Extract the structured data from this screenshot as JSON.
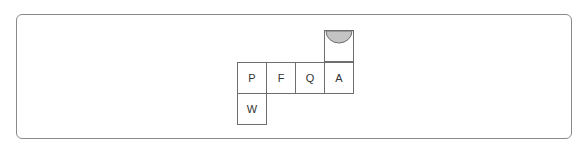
{
  "diagram": {
    "type": "cube-net",
    "colors": {
      "border": "#6e6e6e",
      "semicircle_fill": "#c4c4c4",
      "frame": "#8a8a8a"
    },
    "cells": [
      {
        "id": "top",
        "label": "",
        "col": 3,
        "row": 0,
        "decoration": "semicircle"
      },
      {
        "id": "P",
        "label": "P",
        "col": 0,
        "row": 1
      },
      {
        "id": "F",
        "label": "F",
        "col": 1,
        "row": 1
      },
      {
        "id": "Q",
        "label": "Q",
        "col": 2,
        "row": 1
      },
      {
        "id": "A",
        "label": "A",
        "col": 3,
        "row": 1
      },
      {
        "id": "W",
        "label": "W",
        "col": 0,
        "row": 2
      }
    ]
  }
}
